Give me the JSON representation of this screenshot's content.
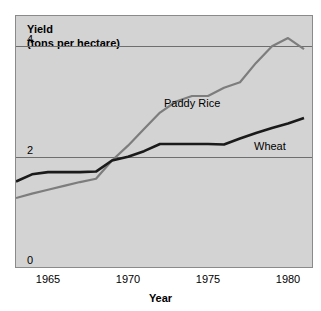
{
  "chart_data": {
    "type": "line",
    "title": "Yield",
    "subtitle": "(tons per hectare)",
    "ylabel": "Yield (tons per hectare)",
    "xlabel": "Year",
    "xlim": [
      1963,
      1981.5
    ],
    "ylim": [
      0,
      4.55
    ],
    "grid": "horizontal gridlines at y=2 and y=4 only",
    "legend_position": "inline labels beside each line",
    "ytick_labels": [
      "0",
      "2",
      "4"
    ],
    "ytick_values": [
      0,
      2,
      4
    ],
    "xtick_labels": [
      "1965",
      "1970",
      "1975",
      "1980"
    ],
    "xtick_values": [
      1965,
      1970,
      1975,
      1980
    ],
    "series": [
      {
        "name": "Paddy Rice",
        "color": "#7d7d7d",
        "x": [
          1963,
          1964,
          1965,
          1966,
          1967,
          1968,
          1969,
          1970,
          1971,
          1972,
          1973,
          1974,
          1975,
          1976,
          1977,
          1978,
          1979,
          1980,
          1981
        ],
        "values": [
          1.25,
          1.33,
          1.4,
          1.47,
          1.54,
          1.6,
          1.93,
          2.2,
          2.5,
          2.8,
          3.0,
          3.1,
          3.1,
          3.25,
          3.35,
          3.7,
          4.0,
          4.15,
          3.95
        ]
      },
      {
        "name": "Wheat",
        "color": "#1a1a1a",
        "x": [
          1963,
          1964,
          1965,
          1966,
          1967,
          1968,
          1969,
          1970,
          1971,
          1972,
          1973,
          1974,
          1975,
          1976,
          1977,
          1978,
          1979,
          1980,
          1981
        ],
        "values": [
          1.55,
          1.68,
          1.72,
          1.72,
          1.72,
          1.73,
          1.93,
          2.0,
          2.1,
          2.23,
          2.23,
          2.23,
          2.23,
          2.22,
          2.33,
          2.43,
          2.52,
          2.6,
          2.7
        ]
      }
    ]
  },
  "labels": {
    "yield_line1": "Yield",
    "yield_line2": "(tons per hectare)",
    "xaxis_title": "Year",
    "series_paddy_rice": "Paddy Rice",
    "series_wheat": "Wheat"
  }
}
